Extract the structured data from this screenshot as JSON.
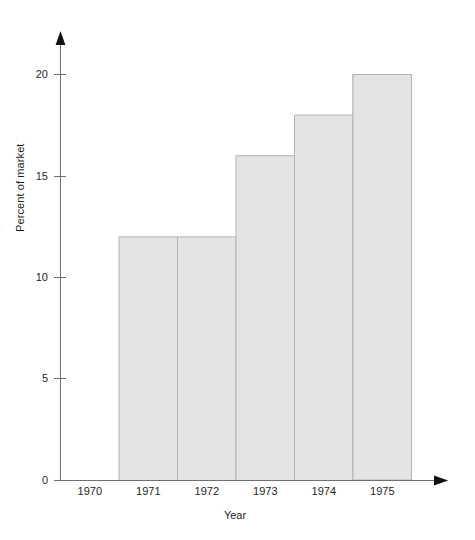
{
  "chart_data": {
    "type": "bar",
    "title": "",
    "xlabel": "Year",
    "ylabel": "Percent of market",
    "categories": [
      "1970",
      "1971",
      "1972",
      "1973",
      "1974",
      "1975"
    ],
    "values": [
      10,
      12,
      12,
      16,
      18,
      20
    ],
    "ylim": [
      0,
      21
    ],
    "yticks": [
      0,
      5,
      10,
      15,
      20
    ],
    "ytick_labels": [
      "0",
      "5",
      "10",
      "15",
      "20"
    ],
    "xtick_labels": [
      "1970",
      "1971",
      "1972",
      "1973",
      "1974",
      "1975"
    ],
    "grid": false,
    "legend": null,
    "bar_gap": 0,
    "colors": {
      "bar_fill": "#e4e4e4",
      "bar_stroke": "#b4b4b4",
      "axis": "#6f6f6f",
      "arrow": "#111111",
      "text": "#1f1f1f",
      "background": "#ffffff"
    },
    "axis_style": {
      "y_arrow": true,
      "x_arrow": true,
      "tick_side": "outside"
    }
  }
}
